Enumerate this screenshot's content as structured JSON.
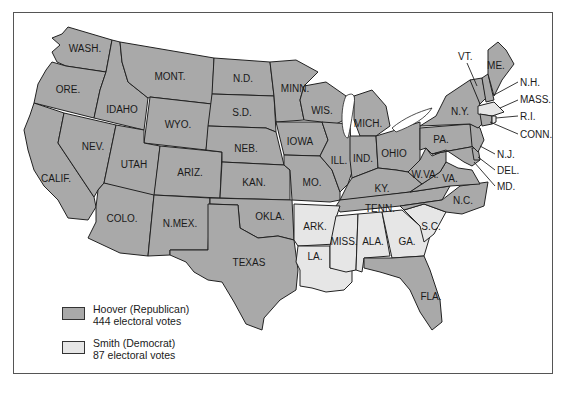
{
  "map": {
    "title": "",
    "colors": {
      "republican": "#a9a9a9",
      "democrat": "#e6e6e6",
      "border": "#222222",
      "background": "#ffffff"
    },
    "states": [
      {
        "id": "WA",
        "label": "WASH.",
        "party": "republican"
      },
      {
        "id": "OR",
        "label": "ORE.",
        "party": "republican"
      },
      {
        "id": "CA",
        "label": "CALIF.",
        "party": "republican"
      },
      {
        "id": "ID",
        "label": "IDAHO",
        "party": "republican"
      },
      {
        "id": "NV",
        "label": "NEV.",
        "party": "republican"
      },
      {
        "id": "MT",
        "label": "MONT.",
        "party": "republican"
      },
      {
        "id": "WY",
        "label": "WYO.",
        "party": "republican"
      },
      {
        "id": "UT",
        "label": "UTAH",
        "party": "republican"
      },
      {
        "id": "AZ",
        "label": "ARIZ.",
        "party": "republican"
      },
      {
        "id": "CO",
        "label": "COLO.",
        "party": "republican"
      },
      {
        "id": "NM",
        "label": "N.MEX.",
        "party": "republican"
      },
      {
        "id": "ND",
        "label": "N.D.",
        "party": "republican"
      },
      {
        "id": "SD",
        "label": "S.D.",
        "party": "republican"
      },
      {
        "id": "NE",
        "label": "NEB.",
        "party": "republican"
      },
      {
        "id": "KS",
        "label": "KAN.",
        "party": "republican"
      },
      {
        "id": "OK",
        "label": "OKLA.",
        "party": "republican"
      },
      {
        "id": "TX",
        "label": "TEXAS",
        "party": "republican"
      },
      {
        "id": "MN",
        "label": "MINN.",
        "party": "republican"
      },
      {
        "id": "IA",
        "label": "IOWA",
        "party": "republican"
      },
      {
        "id": "MO",
        "label": "MO.",
        "party": "republican"
      },
      {
        "id": "AR",
        "label": "ARK.",
        "party": "democrat"
      },
      {
        "id": "LA",
        "label": "LA.",
        "party": "democrat"
      },
      {
        "id": "WI",
        "label": "WIS.",
        "party": "republican"
      },
      {
        "id": "IL",
        "label": "ILL.",
        "party": "republican"
      },
      {
        "id": "MI",
        "label": "MICH.",
        "party": "republican"
      },
      {
        "id": "IN",
        "label": "IND.",
        "party": "republican"
      },
      {
        "id": "OH",
        "label": "OHIO",
        "party": "republican"
      },
      {
        "id": "KY",
        "label": "KY.",
        "party": "republican"
      },
      {
        "id": "TN",
        "label": "TENN.",
        "party": "republican"
      },
      {
        "id": "MS",
        "label": "MISS.",
        "party": "democrat"
      },
      {
        "id": "AL",
        "label": "ALA.",
        "party": "democrat"
      },
      {
        "id": "GA",
        "label": "GA.",
        "party": "democrat"
      },
      {
        "id": "FL",
        "label": "FLA.",
        "party": "republican"
      },
      {
        "id": "SC",
        "label": "S.C.",
        "party": "democrat"
      },
      {
        "id": "NC",
        "label": "N.C.",
        "party": "republican"
      },
      {
        "id": "VA",
        "label": "VA.",
        "party": "republican"
      },
      {
        "id": "WV",
        "label": "W.VA.",
        "party": "republican"
      },
      {
        "id": "PA",
        "label": "PA.",
        "party": "republican"
      },
      {
        "id": "NY",
        "label": "N.Y.",
        "party": "republican"
      },
      {
        "id": "ME",
        "label": "ME.",
        "party": "republican"
      },
      {
        "id": "VT",
        "label": "VT.",
        "party": "republican"
      },
      {
        "id": "NH",
        "label": "N.H.",
        "party": "republican"
      },
      {
        "id": "MA",
        "label": "MASS.",
        "party": "democrat"
      },
      {
        "id": "RI",
        "label": "R.I.",
        "party": "democrat"
      },
      {
        "id": "CT",
        "label": "CONN.",
        "party": "republican"
      },
      {
        "id": "NJ",
        "label": "N.J.",
        "party": "republican"
      },
      {
        "id": "DE",
        "label": "DEL.",
        "party": "republican"
      },
      {
        "id": "MD",
        "label": "MD.",
        "party": "republican"
      }
    ]
  },
  "legend": {
    "items": [
      {
        "name": "Hoover (Republican)",
        "detail": "444 electoral votes",
        "color": "#a9a9a9"
      },
      {
        "name": "Smith (Democrat)",
        "detail": "87 electoral votes",
        "color": "#e6e6e6"
      }
    ]
  }
}
